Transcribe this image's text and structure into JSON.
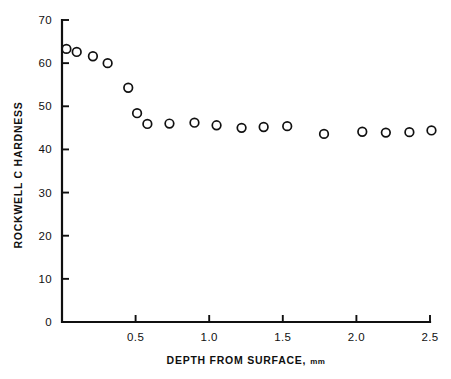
{
  "chart_data": {
    "type": "scatter",
    "title": "",
    "xlabel": "DEPTH FROM SURFACE, mm",
    "ylabel": "ROCKWELL C HARDNESS",
    "xlim": [
      0,
      2.5
    ],
    "ylim": [
      0,
      70
    ],
    "grid": false,
    "legend": null,
    "marker": "open-circle",
    "xticks": [
      0,
      0.5,
      1.0,
      1.5,
      2.0,
      2.5
    ],
    "xtick_labels": [
      "",
      "0.5",
      "1.0",
      "1.5",
      "2.0",
      "2.5"
    ],
    "yticks": [
      0,
      10,
      20,
      30,
      40,
      50,
      60,
      70
    ],
    "ytick_labels": [
      "0",
      "10",
      "20",
      "30",
      "40",
      "50",
      "60",
      "70"
    ],
    "series": [
      {
        "name": "hardness-profile",
        "x": [
          0.03,
          0.1,
          0.21,
          0.31,
          0.45,
          0.51,
          0.58,
          0.73,
          0.9,
          1.05,
          1.22,
          1.37,
          1.53,
          1.78,
          2.04,
          2.2,
          2.36,
          2.51
        ],
        "y": [
          63.3,
          62.6,
          61.6,
          60.0,
          54.3,
          48.4,
          45.9,
          46.0,
          46.2,
          45.6,
          45.0,
          45.2,
          45.4,
          43.6,
          44.1,
          43.9,
          44.0,
          44.4
        ]
      }
    ]
  },
  "axes": {
    "x_unit_suffix": "mm",
    "x_title_main": "DEPTH FROM SURFACE,"
  }
}
